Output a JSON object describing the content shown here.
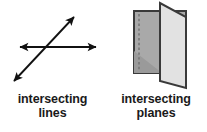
{
  "figure_left": {
    "name": "intersecting-lines",
    "caption_line1": "intersecting",
    "caption_line2": "lines",
    "stroke_color": "#111111",
    "lines": [
      {
        "name": "horizontal-line",
        "x1": 18,
        "y1": 47,
        "x2": 98,
        "y2": 47,
        "arrowheads": "both"
      },
      {
        "name": "diagonal-line",
        "x1": 11,
        "y1": 85,
        "x2": 77,
        "y2": 14,
        "arrowheads": "both"
      }
    ],
    "intersection_point": {
      "x": 48,
      "y": 47
    }
  },
  "figure_right": {
    "name": "intersecting-planes",
    "caption_line1": "intersecting",
    "caption_line2": "planes",
    "back_plane": {
      "name": "back-plane",
      "fill": "#a9a9a9",
      "stroke": "#3a3a3a",
      "points": "29,11 81,11 81,73 29,73"
    },
    "back_plane_shade": {
      "name": "back-plane-shadow",
      "fill": "#989898",
      "points": "29,73 29,52 56,73"
    },
    "front_plane": {
      "name": "front-plane",
      "fill": "#e2e2e2",
      "stroke": "#3a3a3a",
      "points": "55,3 55,81 81,88 81,17"
    },
    "hidden_edge": {
      "name": "hidden-intersection-line",
      "stroke": "#6e6e6e",
      "x1": 34,
      "y1": 14,
      "x2": 34,
      "y2": 70,
      "style": "dashed"
    }
  }
}
